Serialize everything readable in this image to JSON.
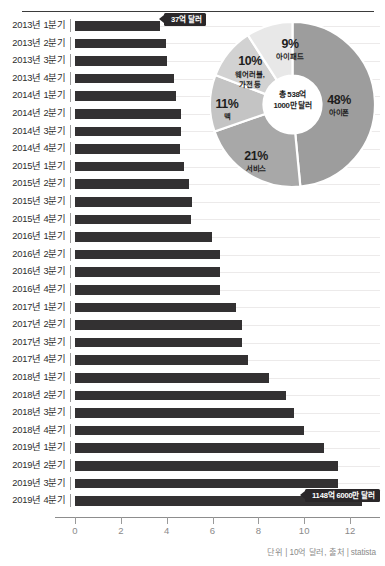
{
  "chart_data": [
    {
      "type": "bar",
      "orientation": "horizontal",
      "title": "",
      "xlabel": "",
      "ylabel": "",
      "unit_note": "단위 | 10억 달러, 출처 | statista",
      "xlim": [
        0,
        13.2
      ],
      "xticks": [
        0,
        2,
        4,
        6,
        8,
        10,
        12
      ],
      "xticklabels": [
        "0",
        "2",
        "4",
        "6",
        "8",
        "10",
        "12"
      ],
      "grid": true,
      "bar_color": "#333132",
      "categories": [
        "2013년 1분기",
        "2013년 2분기",
        "2013년 3분기",
        "2013년 4분기",
        "2014년 1분기",
        "2014년 2분기",
        "2014년 3분기",
        "2014년 4분기",
        "2015년 1분기",
        "2015년 2분기",
        "2015년 3분기",
        "2015년 4분기",
        "2016년 1분기",
        "2016년 2분기",
        "2016년 3분기",
        "2016년 4분기",
        "2017년 1분기",
        "2017년 2분기",
        "2017년 3분기",
        "2017년 4분기",
        "2018년 1분기",
        "2018년 2분기",
        "2018년 3분기",
        "2018년 4분기",
        "2019년 1분기",
        "2019년 2분기",
        "2019년 3분기",
        "2019년 4분기"
      ],
      "values": [
        3.7,
        3.99,
        4.0,
        4.31,
        4.4,
        4.61,
        4.61,
        4.57,
        4.76,
        4.99,
        5.09,
        5.05,
        5.99,
        6.33,
        6.33,
        6.33,
        7.04,
        7.27,
        7.27,
        7.55,
        8.47,
        9.19,
        9.55,
        9.98,
        10.88,
        11.46,
        11.46,
        12.51
      ],
      "annotations": [
        {
          "category": "2013년 1분기",
          "label": "37억 달러"
        },
        {
          "category": "2019년 4분기",
          "label": "1148억 6000만 달러"
        }
      ]
    },
    {
      "type": "pie",
      "variant": "donut",
      "title": "",
      "center_label": "총 538억\n1000만 달러",
      "center_line1": "총 538억",
      "center_line2": "1000만 달러",
      "labels": [
        "아이폰",
        "서비스",
        "맥",
        "웨어러블, 가전 등",
        "아이패드"
      ],
      "values": [
        48,
        21,
        11,
        10,
        9
      ],
      "percent_labels": [
        "48%",
        "21%",
        "11%",
        "10%",
        "9%"
      ],
      "colors": [
        "#9d9d9d",
        "#a8a8a8",
        "#c4c4c4",
        "#d2d2d2",
        "#e8e8e8"
      ],
      "legend": "inline"
    }
  ],
  "axis": {
    "footer": "단위 | 10억 달러, 출처 | statista"
  },
  "donut": {
    "iphone": {
      "pct": "48%",
      "name": "아이폰"
    },
    "services": {
      "pct": "21%",
      "name": "서비스"
    },
    "mac": {
      "pct": "11%",
      "name": "맥"
    },
    "wearables": {
      "pct": "10%",
      "name_line1": "웨어러블,",
      "name_line2": "가전 등"
    },
    "ipad": {
      "pct": "9%",
      "name": "아이패드"
    },
    "center_line1": "총 538억",
    "center_line2": "1000만 달러"
  },
  "callouts": {
    "first": "37억 달러",
    "last": "1148억 6000만 달러"
  }
}
